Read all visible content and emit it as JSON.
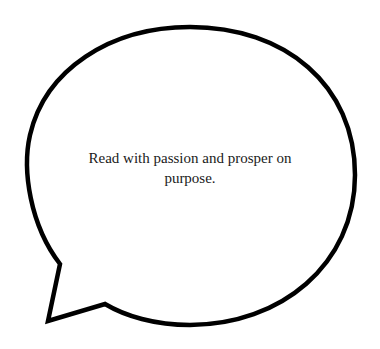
{
  "bubble": {
    "text_line1": "Read with passion and prosper on",
    "text_line2": "purpose.",
    "stroke_color": "#000000",
    "fill_color": "#ffffff"
  }
}
